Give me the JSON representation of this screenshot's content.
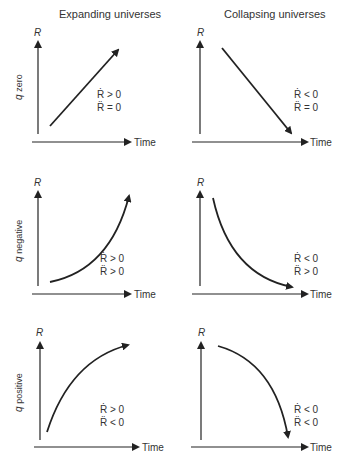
{
  "columns": {
    "left": "Expanding universes",
    "right": "Collapsing universes"
  },
  "rows": [
    {
      "label": "q zero",
      "q": "q",
      "sub": "zero"
    },
    {
      "label": "q negative",
      "q": "q",
      "sub": "negative"
    },
    {
      "label": "q positive",
      "q": "q",
      "sub": "positive"
    }
  ],
  "axes": {
    "y": "R",
    "x": "Time"
  },
  "panels": [
    {
      "row": 0,
      "col": "expanding",
      "cond1": "Ṙ > 0",
      "cond2": "R̈ = 0"
    },
    {
      "row": 0,
      "col": "collapsing",
      "cond1": "Ṙ < 0",
      "cond2": "R̈ = 0"
    },
    {
      "row": 1,
      "col": "expanding",
      "cond1": "Ṙ > 0",
      "cond2": "R̈ > 0"
    },
    {
      "row": 1,
      "col": "collapsing",
      "cond1": "Ṙ < 0",
      "cond2": "R̈ > 0"
    },
    {
      "row": 2,
      "col": "expanding",
      "cond1": "Ṙ > 0",
      "cond2": "R̈ < 0"
    },
    {
      "row": 2,
      "col": "collapsing",
      "cond1": "Ṙ < 0",
      "cond2": "R̈ < 0"
    }
  ]
}
